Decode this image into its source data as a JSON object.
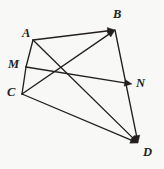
{
  "figure": {
    "background_color": "#f8f8f6",
    "line_color": "#231f20",
    "width": 164,
    "height": 169
  },
  "points": {
    "A": {
      "label": "A",
      "x": 33,
      "y": 40,
      "label_x": 22,
      "label_y": 27
    },
    "B": {
      "label": "B",
      "x": 115,
      "y": 30,
      "label_x": 113,
      "label_y": 8
    },
    "C": {
      "label": "C",
      "x": 22,
      "y": 94,
      "label_x": 7,
      "label_y": 86
    },
    "D": {
      "label": "D",
      "x": 138,
      "y": 143,
      "label_x": 143,
      "label_y": 146
    },
    "M": {
      "label": "M",
      "x": 26,
      "y": 67,
      "label_x": 8,
      "label_y": 58
    },
    "N": {
      "label": "N",
      "x": 132,
      "y": 84,
      "label_x": 136,
      "label_y": 77
    }
  },
  "segments": [
    {
      "name": "segment-A-M",
      "from": "A",
      "to": "M",
      "arrow": false
    },
    {
      "name": "segment-M-C",
      "from": "M",
      "to": "C",
      "arrow": false
    },
    {
      "name": "vector-A-B",
      "from": "A",
      "to": "B",
      "arrow": true
    },
    {
      "name": "vector-C-B",
      "from": "C",
      "to": "B",
      "arrow": true
    },
    {
      "name": "vector-A-D",
      "from": "A",
      "to": "D",
      "arrow": true
    },
    {
      "name": "vector-C-D",
      "from": "C",
      "to": "D",
      "arrow": true
    },
    {
      "name": "vector-M-N",
      "from": "M",
      "to": "N",
      "arrow": true
    },
    {
      "name": "vector-B-D",
      "from": "B",
      "to": "D",
      "arrow": true
    }
  ],
  "chart_data": {
    "type": "diagram",
    "vertices": [
      {
        "id": "A",
        "x": 33,
        "y": 40
      },
      {
        "id": "B",
        "x": 115,
        "y": 30
      },
      {
        "id": "C",
        "x": 22,
        "y": 94
      },
      {
        "id": "D",
        "x": 138,
        "y": 143
      },
      {
        "id": "M",
        "x": 26,
        "y": 67
      },
      {
        "id": "N",
        "x": 132,
        "y": 84
      }
    ],
    "edges": [
      {
        "from": "A",
        "to": "B",
        "directed": true
      },
      {
        "from": "A",
        "to": "D",
        "directed": true
      },
      {
        "from": "C",
        "to": "B",
        "directed": true
      },
      {
        "from": "C",
        "to": "D",
        "directed": true
      },
      {
        "from": "B",
        "to": "D",
        "directed": true
      },
      {
        "from": "M",
        "to": "N",
        "directed": true
      },
      {
        "from": "A",
        "to": "C",
        "directed": false
      }
    ]
  }
}
